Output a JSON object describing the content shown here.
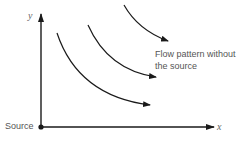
{
  "diagram": {
    "axes": {
      "x_label": "x",
      "y_label": "y",
      "origin_label": "Source"
    },
    "annotation": {
      "line1": "Flow pattern without",
      "line2": "the source"
    },
    "streamlines": [
      {
        "name": "streamline-1",
        "direction": "downward-right"
      },
      {
        "name": "streamline-2",
        "direction": "downward-right"
      },
      {
        "name": "streamline-3",
        "direction": "downward-right"
      }
    ],
    "colors": {
      "line": "#1a1a1a",
      "text": "#555555"
    }
  }
}
